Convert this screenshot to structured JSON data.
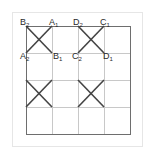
{
  "diagram": {
    "grid": {
      "cols": 4,
      "rows": 4,
      "x0": 26,
      "y0": 26,
      "cell_w": 26,
      "cell_h": 27
    },
    "colors": {
      "grid_line": "#c8c8c8",
      "border": "#6e6e6e",
      "cross": "#444444",
      "frame": "#e6e6e6"
    },
    "crosses": [
      {
        "col": 0,
        "row": 0
      },
      {
        "col": 2,
        "row": 0
      },
      {
        "col": 0,
        "row": 2
      },
      {
        "col": 2,
        "row": 2
      }
    ],
    "labels": [
      {
        "id": "B2",
        "base": "B",
        "sub": "2",
        "x": 20,
        "y": 25
      },
      {
        "id": "A1",
        "base": "A",
        "sub": "1",
        "x": 49,
        "y": 25
      },
      {
        "id": "A2",
        "base": "A",
        "sub": "2",
        "x": 20,
        "y": 59
      },
      {
        "id": "B1",
        "base": "B",
        "sub": "1",
        "x": 53,
        "y": 59
      },
      {
        "id": "D2",
        "base": "D",
        "sub": "2",
        "x": 73,
        "y": 25
      },
      {
        "id": "C1",
        "base": "C",
        "sub": "1",
        "x": 100,
        "y": 25
      },
      {
        "id": "C2",
        "base": "C",
        "sub": "2",
        "x": 72,
        "y": 59
      },
      {
        "id": "D1",
        "base": "D",
        "sub": "1",
        "x": 103,
        "y": 59
      }
    ]
  }
}
